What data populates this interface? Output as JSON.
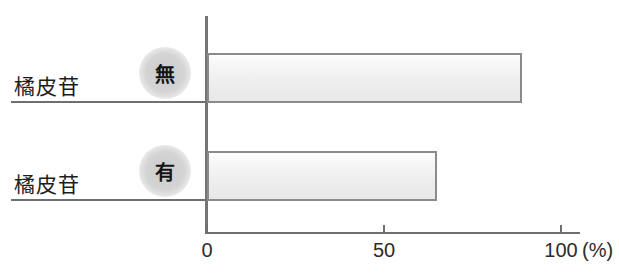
{
  "chart_data": {
    "type": "bar",
    "orientation": "horizontal",
    "title": "",
    "xlabel": "(%)",
    "ylabel": "",
    "categories": [
      "橘皮苷 無",
      "橘皮苷 有"
    ],
    "values": [
      89,
      65
    ],
    "xlim": [
      0,
      100
    ],
    "xticks": [
      0,
      50,
      100
    ],
    "xtick_labels": [
      "0",
      "50",
      "100"
    ],
    "unit": "(%)",
    "grid": false,
    "legend": false,
    "series": [
      {
        "name": "",
        "values": [
          89,
          65
        ]
      }
    ],
    "bar_fill_color": "#f0f0f0",
    "bar_border_color": "#8b8b8b",
    "axis_color": "#6f6f6f"
  },
  "categories": [
    {
      "name": "橘皮苷",
      "badge": "無",
      "value": 89
    },
    {
      "name": "橘皮苷",
      "badge": "有",
      "value": 65
    }
  ],
  "axis": {
    "ticks": [
      {
        "label": "0",
        "value": 0
      },
      {
        "label": "50",
        "value": 50
      },
      {
        "label": "100",
        "value": 100
      }
    ],
    "unit": "(%)"
  }
}
